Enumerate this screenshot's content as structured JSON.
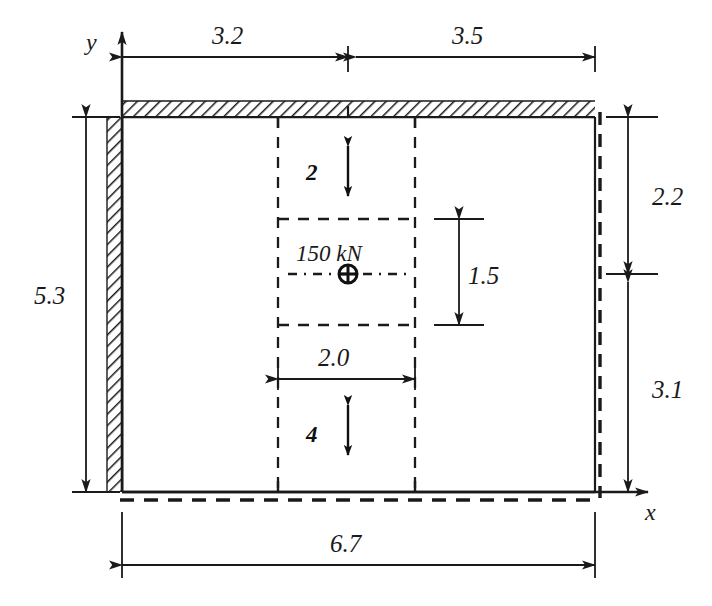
{
  "figure": {
    "type": "engineering-dimensioned-diagram",
    "background_color": "#ffffff",
    "line_color": "#1a1a1a"
  },
  "axes": {
    "x_label": "x",
    "y_label": "y",
    "origin_x": 122,
    "origin_y": 492
  },
  "load": {
    "label": "150 kN",
    "symbol": "circled-plus",
    "x": 348,
    "y": 274
  },
  "dimensions": {
    "top_left": "3.2",
    "top_right": "3.5",
    "left_total": "5.3",
    "right_upper": "2.2",
    "right_lower": "3.1",
    "bottom_total": "6.7",
    "inner_width": "2.0",
    "inner_height": "1.5",
    "gap_top": "2",
    "gap_bottom": "4"
  },
  "geometry": {
    "plate_left": 122,
    "plate_right": 595,
    "plate_top": 117,
    "plate_bottom": 492,
    "inner_left": 278,
    "inner_right": 415,
    "inner_top": 219,
    "inner_bottom": 325,
    "center_x": 348,
    "center_y": 274
  }
}
